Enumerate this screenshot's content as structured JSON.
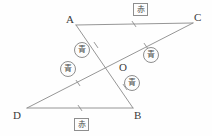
{
  "figure": {
    "width": 212,
    "height": 136,
    "background_color": "#fefefe",
    "stroke_color": "#8a8a8a",
    "label_color": "#3a3a3a",
    "marker_border_color": "#8e8e8e",
    "points": {
      "A": {
        "label": "A",
        "x": 76,
        "y": 25,
        "label_x": 66,
        "label_y": 14
      },
      "B": {
        "label": "B",
        "x": 133,
        "y": 108,
        "label_x": 134,
        "label_y": 110
      },
      "C": {
        "label": "C",
        "x": 193,
        "y": 23,
        "label_x": 194,
        "label_y": 12
      },
      "D": {
        "label": "D",
        "x": 27,
        "y": 108,
        "label_x": 13,
        "label_y": 110
      },
      "O": {
        "label": "O",
        "x": 116,
        "y": 66,
        "label_x": 119,
        "label_y": 62
      }
    },
    "segments": [
      {
        "name": "segment-AC",
        "from": "A",
        "to": "C",
        "tick_count": 1
      },
      {
        "name": "segment-DB",
        "from": "D",
        "to": "B",
        "tick_count": 1
      },
      {
        "name": "segment-AB",
        "from": "A",
        "to": "B",
        "tick_count": 0
      },
      {
        "name": "segment-DC",
        "from": "D",
        "to": "C",
        "tick_count": 0
      }
    ],
    "tick_marks": [
      {
        "name": "tick-AC-midpoint",
        "x": 134,
        "y": 24
      },
      {
        "name": "tick-DB-midpoint",
        "x": 80,
        "y": 108
      },
      {
        "name": "tick-AO",
        "x": 96,
        "y": 45
      },
      {
        "name": "tick-OB",
        "x": 125,
        "y": 87
      },
      {
        "name": "tick-DO",
        "x": 78,
        "y": 83
      },
      {
        "name": "tick-OC",
        "x": 146,
        "y": 46
      }
    ],
    "markers": [
      {
        "name": "marker-red-top",
        "text": "赤",
        "shape": "box",
        "x": 133,
        "y": 3
      },
      {
        "name": "marker-red-bottom",
        "text": "赤",
        "shape": "box",
        "x": 74,
        "y": 118
      },
      {
        "name": "marker-blue-upper-left",
        "text": "青",
        "shape": "circle",
        "x": 74,
        "y": 42
      },
      {
        "name": "marker-blue-lower-left",
        "text": "青",
        "shape": "circle",
        "x": 60,
        "y": 61
      },
      {
        "name": "marker-blue-upper-right",
        "text": "青",
        "shape": "circle",
        "x": 143,
        "y": 47
      },
      {
        "name": "marker-blue-lower-right",
        "text": "青",
        "shape": "circle",
        "x": 124,
        "y": 75
      }
    ]
  }
}
